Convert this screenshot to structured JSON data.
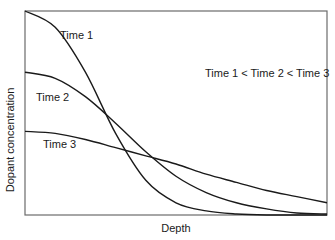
{
  "chart_data": {
    "type": "line",
    "title": "",
    "xlabel": "Depth",
    "ylabel": "Dopant concentration",
    "annotation": "Time 1 < Time 2 < Time 3",
    "grid": false,
    "legend": "inline labels",
    "xlim": [
      0,
      1
    ],
    "ylim": [
      0,
      1
    ],
    "x_ticks": [],
    "y_ticks": [],
    "x": [
      0,
      0.1,
      0.2,
      0.3,
      0.4,
      0.5,
      0.6,
      0.7,
      0.8,
      0.9,
      1.0
    ],
    "series": [
      {
        "name": "Time 1",
        "label": "Time 1",
        "values": [
          1.0,
          0.92,
          0.7,
          0.4,
          0.17,
          0.06,
          0.02,
          0.005,
          0.0,
          0.0,
          0.0
        ]
      },
      {
        "name": "Time 2",
        "label": "Time 2",
        "values": [
          0.7,
          0.67,
          0.58,
          0.45,
          0.31,
          0.19,
          0.11,
          0.06,
          0.03,
          0.01,
          0.005
        ]
      },
      {
        "name": "Time 3",
        "label": "Time 3",
        "values": [
          0.41,
          0.4,
          0.37,
          0.33,
          0.29,
          0.25,
          0.2,
          0.16,
          0.12,
          0.09,
          0.06
        ]
      }
    ]
  },
  "frame": {
    "left": 25,
    "top": 11,
    "right": 327,
    "bottom": 215
  },
  "colors": {
    "line": "#1a1a1a",
    "axis": "#555555",
    "background": "#ffffff"
  }
}
